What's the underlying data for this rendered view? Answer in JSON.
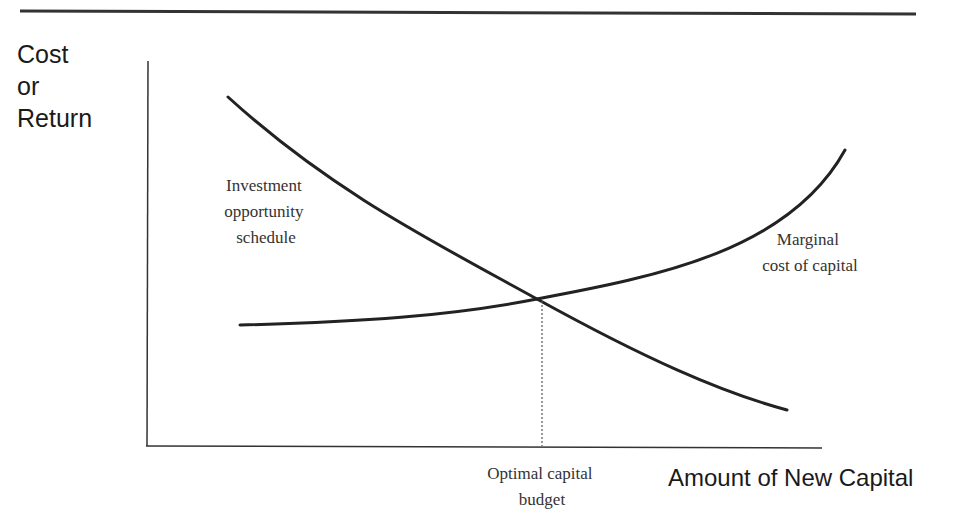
{
  "diagram": {
    "type": "economics-schedule",
    "y_axis_label": [
      "Cost",
      "or",
      "Return"
    ],
    "x_axis_label": "Amount of New Capital",
    "curves": [
      {
        "name": "investment-opportunity-schedule",
        "label": [
          "Investment",
          "opportunity",
          "schedule"
        ],
        "direction": "downward-sloping"
      },
      {
        "name": "marginal-cost-of-capital",
        "label": [
          "Marginal",
          "cost of capital"
        ],
        "direction": "upward-sloping"
      }
    ],
    "intersection_label": [
      "Optimal capital",
      "budget"
    ],
    "colors": {
      "line": "#222222",
      "text_sans": "#1a1a1a",
      "text_serif": "#333333",
      "background": "#ffffff"
    }
  }
}
